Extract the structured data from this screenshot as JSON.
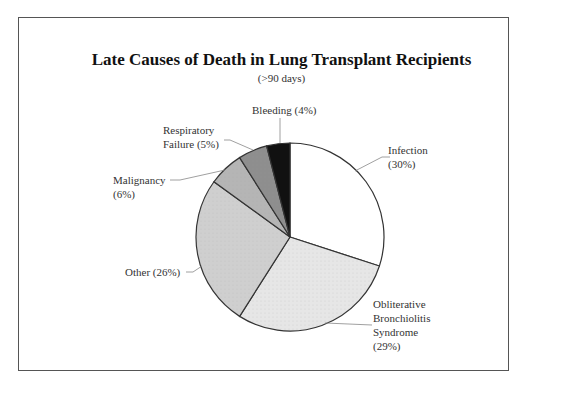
{
  "chart_data": {
    "type": "pie",
    "title": "Late Causes of Death in Lung Transplant Recipients",
    "subtitle": "(>90 days)",
    "start_angle": "12 o'clock, clockwise",
    "categories": [
      "Infection",
      "Obliterative Bronchiolitis Syndrome",
      "Other",
      "Malignancy",
      "Respiratory Failure",
      "Bleeding"
    ],
    "values": [
      30,
      29,
      26,
      6,
      5,
      4
    ],
    "unit": "%",
    "colors": [
      "#ffffff",
      "#e6e6e6",
      "#cfcfcf",
      "#b5b5b5",
      "#8e8e8e",
      "#111111"
    ],
    "labels": [
      {
        "lines": [
          "Infection",
          "(30%)"
        ]
      },
      {
        "lines": [
          "Obliterative",
          "Bronchiolitis",
          "Syndrome",
          "(29%)"
        ]
      },
      {
        "lines": [
          "Other (26%)"
        ]
      },
      {
        "lines": [
          "Malignancy",
          "(6%)"
        ]
      },
      {
        "lines": [
          "Respiratory",
          "Failure (5%)"
        ]
      },
      {
        "lines": [
          "Bleeding (4%)"
        ]
      }
    ],
    "legend": "none (leader-line labels)"
  }
}
